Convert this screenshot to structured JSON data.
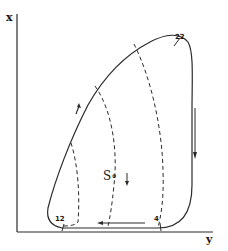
{
  "axes": {
    "vertical_label": "x",
    "horizontal_label": "y"
  },
  "points": {
    "top": "22",
    "bottom_left": "12",
    "bottom_right": "4"
  },
  "center_label": "S∘",
  "colors": {
    "line": "#2a2a2a",
    "background": "#ffffff"
  }
}
